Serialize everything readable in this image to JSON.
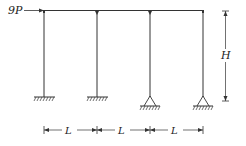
{
  "diagram": {
    "type": "structural-frame",
    "load": {
      "label": "9P",
      "direction": "right",
      "applied_at": "top-left joint"
    },
    "height_label": "H",
    "span_labels": [
      "L",
      "L",
      "L"
    ],
    "columns": [
      {
        "index": 1,
        "support": "fixed",
        "top_joint": "rigid"
      },
      {
        "index": 2,
        "support": "fixed",
        "top_joint": "hinge"
      },
      {
        "index": 3,
        "support": "pinned",
        "top_joint": "hinge"
      },
      {
        "index": 4,
        "support": "pinned",
        "top_joint": "rigid"
      }
    ],
    "colors": {
      "line": "#333333",
      "background": "#ffffff"
    }
  }
}
